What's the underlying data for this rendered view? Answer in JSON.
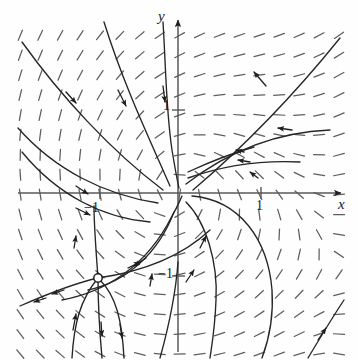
{
  "figure": {
    "kind": "phase-portrait",
    "title": "",
    "background_color": "#fefefe",
    "ink_color": "#2a2a2a",
    "axis_color": "#555555"
  },
  "axes": {
    "x_label": "x",
    "y_label": "y",
    "x_axis_y_pixel": 193,
    "y_axis_x_pixel": 178,
    "unit_pixels": 83,
    "x_range": [
      -1.95,
      2.05
    ],
    "y_range": [
      1.97,
      -2.02
    ],
    "ticks": {
      "x": [
        {
          "value": -1,
          "label": "−1"
        },
        {
          "value": 1,
          "label": "1"
        }
      ],
      "y": [
        {
          "value": 1,
          "label": "1"
        },
        {
          "value": -1,
          "label": "−1"
        }
      ]
    }
  },
  "chart_data": {
    "type": "scatter",
    "title": "",
    "xlabel": "x",
    "ylabel": "y",
    "xlim": [
      -1.95,
      2.05
    ],
    "ylim": [
      -2.02,
      1.97
    ],
    "grid": false,
    "legend": null,
    "slope_field": {
      "x_start": -1.9,
      "x_step": 0.24,
      "x_count": 17,
      "y_start": 1.9,
      "y_step": -0.24,
      "y_count": 17,
      "tick_length_px": 11
    },
    "equilibria": [
      {
        "name": "spiral-sink",
        "x": 0,
        "y": 0,
        "marker": "none"
      },
      {
        "name": "saddle",
        "x": -0.96,
        "y": -1.03,
        "marker": "open-circle"
      }
    ],
    "trajectories": 14
  }
}
